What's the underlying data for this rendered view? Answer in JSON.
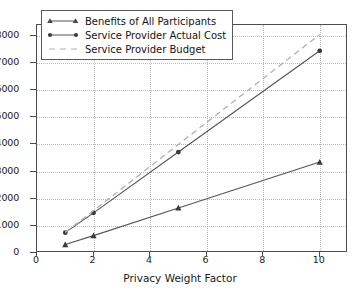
{
  "chart_data": {
    "type": "line",
    "title": "",
    "xlabel": "Privacy Weight Factor",
    "ylabel": "",
    "x": [
      1,
      2,
      5,
      10
    ],
    "xtick_labels": [
      "0",
      "2",
      "4",
      "6",
      "8",
      "10"
    ],
    "xtick_values": [
      0,
      2,
      4,
      6,
      8,
      10
    ],
    "ytick_labels": [
      "0",
      "1000",
      "2000",
      "3000",
      "4000",
      "5000",
      "6000",
      "7000",
      "8000"
    ],
    "ytick_values": [
      0,
      1000,
      2000,
      3000,
      4000,
      5000,
      6000,
      7000,
      8000
    ],
    "xlim": [
      0,
      11
    ],
    "ylim": [
      0,
      8400
    ],
    "grid": true,
    "legend_position": "upper left",
    "series": [
      {
        "name": "Benefits of All Participants",
        "marker": "triangle",
        "linestyle": "solid",
        "color": "#555555",
        "values": [
          310,
          640,
          1660,
          3350
        ]
      },
      {
        "name": "Service Provider Actual Cost",
        "marker": "circle",
        "linestyle": "solid",
        "color": "#555555",
        "values": [
          750,
          1480,
          3720,
          7450
        ]
      },
      {
        "name": "Service Provider Budget",
        "marker": "none",
        "linestyle": "dashed",
        "color": "#b0b0b0",
        "values": [
          760,
          1560,
          4000,
          8050
        ]
      }
    ]
  },
  "legend": {
    "items": [
      {
        "label": "Benefits of All Participants"
      },
      {
        "label": "Service Provider Actual Cost"
      },
      {
        "label": "Service Provider Budget"
      }
    ]
  },
  "colors": {
    "axis": "#4d4d4d",
    "grid": "#bdbdbd",
    "series_solid": "#555555",
    "series_dashed": "#b0b0b0",
    "background": "#ffffff",
    "text": "#1a1a1a"
  }
}
